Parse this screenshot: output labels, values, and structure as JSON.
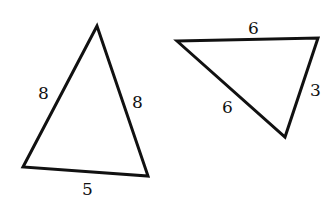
{
  "diagram": {
    "triangles": [
      {
        "id": "triangle-1",
        "vertices": [
          [
            97,
            26
          ],
          [
            23,
            167
          ],
          [
            148,
            176
          ]
        ],
        "side_labels": [
          {
            "side": "left",
            "text": "8",
            "x": 45,
            "y": 99
          },
          {
            "side": "right",
            "text": "8",
            "x": 138,
            "y": 108
          },
          {
            "side": "bottom",
            "text": "5",
            "x": 87,
            "y": 195
          }
        ]
      },
      {
        "id": "triangle-2",
        "vertices": [
          [
            177,
            41
          ],
          [
            318,
            38
          ],
          [
            285,
            137
          ]
        ],
        "side_labels": [
          {
            "side": "top",
            "text": "6",
            "x": 253,
            "y": 34
          },
          {
            "side": "right",
            "text": "3",
            "x": 315,
            "y": 96
          },
          {
            "side": "left",
            "text": "6",
            "x": 227,
            "y": 113
          }
        ]
      }
    ]
  }
}
